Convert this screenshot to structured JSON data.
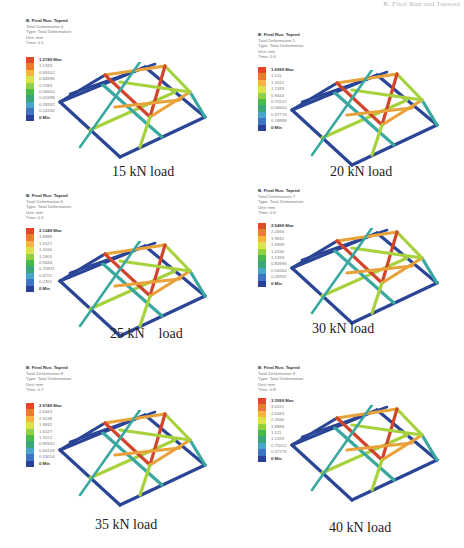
{
  "page_header": "B. Final Run and Tapered",
  "legend_colors": [
    "#e8442a",
    "#f07a2e",
    "#f6b533",
    "#dde43a",
    "#8fd23e",
    "#48b84a",
    "#3aa77a",
    "#49a6c8",
    "#3d73c0",
    "#2a3f97"
  ],
  "frame_colors": {
    "hot": "#d2452d",
    "warm": "#e9a23a",
    "mid": "#a7d23c",
    "cool": "#3aa7a0",
    "cold": "#2b4596"
  },
  "panels": [
    {
      "caption": "15 kN load",
      "title": "B: Final Run. Tapred",
      "result": "Total Deformation 4",
      "type": "Type: Total Deformation",
      "unit": "Unit: mm",
      "time": "Time: 0.5",
      "legend": [
        "1.2749 Max",
        "1.1333",
        "0.99162",
        "0.84996",
        "0.7083",
        "0.56664",
        "0.42498",
        "0.28332",
        "0.14166",
        "0 Min"
      ]
    },
    {
      "caption": "20 kN load",
      "title": "B: Final Run. Tapred",
      "result": "Total Deformation 5",
      "type": "Type: Total Deformation",
      "unit": "Unit: mm",
      "time": "Time: 0.4",
      "legend": [
        "1.6999 Max",
        "1.511",
        "1.3222",
        "1.1333",
        "0.9444",
        "0.75552",
        "0.56664",
        "0.37776",
        "0.18888",
        "0 Min"
      ]
    },
    {
      "caption": "25 kN    load",
      "title": "B: Final Run. Tapred",
      "result": "Total Deformation 6",
      "type": "Type: Total Deformation",
      "unit": "Unit: mm",
      "time": "Time: 0.5",
      "legend": [
        "2.1249 Max",
        "1.8888",
        "1.6527",
        "1.4166",
        "1.1805",
        "0.9444",
        "0.70831",
        "0.4722",
        "0.2361",
        "0 Min"
      ]
    },
    {
      "caption": "30 kN load",
      "title": "B: Final Run. Tapred",
      "result": "Total Deformation 7",
      "type": "Type: Total Deformation",
      "unit": "Unit: mm",
      "time": "Time: 0.6",
      "legend": [
        "2.5499 Max",
        "2.2666",
        "1.9832",
        "1.6999",
        "1.4166",
        "1.1333",
        "0.84996",
        "0.56664",
        "0.28332",
        "0 Min"
      ]
    },
    {
      "caption": "35 kN load",
      "title": "B: Final Run. Tapred",
      "result": "Total Deformation 8",
      "type": "Type: Total Deformation",
      "unit": "Unit: mm",
      "time": "Time: 0.7",
      "legend": [
        "2.9749 Max",
        "2.6443",
        "2.3138",
        "1.9832",
        "1.6527",
        "1.3222",
        "0.99162",
        "0.66108",
        "0.33054",
        "0 Min"
      ]
    },
    {
      "caption": "40 kN load",
      "title": "B: Final Run. Tapred",
      "result": "Total Deformation 9",
      "type": "Type: Total Deformation",
      "unit": "Unit: mm",
      "time": "Time: 0.8",
      "legend": [
        "3.3999 Max",
        "3.0221",
        "2.6443",
        "2.2666",
        "1.8888",
        "1.511",
        "1.1333",
        "0.75552",
        "0.37776",
        "0 Min"
      ]
    }
  ]
}
